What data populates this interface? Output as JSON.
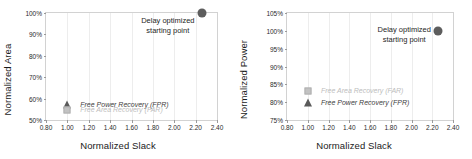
{
  "figure": {
    "panels": [
      {
        "id": "left",
        "ylabel": "Normalized Area",
        "xlabel": "Normalized Slack",
        "yticks": [
          "100%",
          "90%",
          "80%",
          "70%",
          "60%",
          "50%"
        ],
        "xticks": [
          "0.80",
          "1.00",
          "1.20",
          "1.40",
          "1.60",
          "1.80",
          "2.00",
          "2.20",
          "2.40"
        ],
        "annotation_line1": "Delay optimized",
        "annotation_line2": "starting point",
        "label_top": "Free Power Recovery (FPR)",
        "label_bottom": "Free Area Recovery (FAR)"
      },
      {
        "id": "right",
        "ylabel": "Normalized Power",
        "xlabel": "Normalized Slack",
        "yticks": [
          "105%",
          "100%",
          "95%",
          "90%",
          "85%",
          "80%",
          "75%"
        ],
        "xticks": [
          "0.80",
          "1.00",
          "1.20",
          "1.40",
          "1.60",
          "1.80",
          "2.00",
          "2.20",
          "2.40"
        ],
        "annotation_line1": "Delay optimized",
        "annotation_line2": "starting point",
        "label_top": "Free Area Recovery (FAR)",
        "label_bottom": "Free Power Recovery (FPR)"
      }
    ]
  },
  "colors": {
    "circle": "#5d5d5d",
    "triangle": "#5a5a5a",
    "square": "#c2c2c2",
    "grid": "#ededed",
    "frame": "#d2d2d2"
  },
  "chart_data": [
    {
      "type": "scatter",
      "title": "",
      "xlabel": "Normalized Slack",
      "ylabel": "Normalized Area",
      "xlim": [
        0.8,
        2.4
      ],
      "ylim": [
        50,
        100
      ],
      "xticks": [
        0.8,
        1.0,
        1.2,
        1.4,
        1.6,
        1.8,
        2.0,
        2.2,
        2.4
      ],
      "yticks": [
        50,
        60,
        70,
        80,
        90,
        100
      ],
      "ytick_unit": "%",
      "grid": true,
      "legend": "inline-annotations",
      "points": [
        {
          "name": "Delay optimized starting point",
          "marker": "circle",
          "x": 2.26,
          "y": 100
        },
        {
          "name": "Free Power Recovery (FPR)",
          "marker": "triangle",
          "x": 1.0,
          "y": 57
        },
        {
          "name": "Free Area Recovery (FAR)",
          "marker": "square",
          "x": 1.0,
          "y": 54.5
        }
      ],
      "annotations": [
        {
          "text": "Delay optimized starting point",
          "x": 1.95,
          "y": 98
        },
        {
          "text": "Free Power Recovery (FPR)",
          "x": 1.05,
          "y": 57
        },
        {
          "text": "Free Area Recovery (FAR)",
          "x": 1.05,
          "y": 54.5
        }
      ]
    },
    {
      "type": "scatter",
      "title": "",
      "xlabel": "Normalized Slack",
      "ylabel": "Normalized Power",
      "xlim": [
        0.8,
        2.4
      ],
      "ylim": [
        75,
        105
      ],
      "xticks": [
        0.8,
        1.0,
        1.2,
        1.4,
        1.6,
        1.8,
        2.0,
        2.2,
        2.4
      ],
      "yticks": [
        75,
        80,
        85,
        90,
        95,
        100,
        105
      ],
      "ytick_unit": "%",
      "grid": true,
      "legend": "inline-annotations",
      "points": [
        {
          "name": "Delay optimized starting point",
          "marker": "circle",
          "x": 2.26,
          "y": 100
        },
        {
          "name": "Free Area Recovery (FAR)",
          "marker": "square",
          "x": 1.0,
          "y": 83
        },
        {
          "name": "Free Power Recovery (FPR)",
          "marker": "triangle",
          "x": 1.0,
          "y": 79.8
        }
      ],
      "annotations": [
        {
          "text": "Delay optimized starting point",
          "x": 1.95,
          "y": 100
        },
        {
          "text": "Free Area Recovery (FAR)",
          "x": 1.06,
          "y": 83
        },
        {
          "text": "Free Power Recovery (FPR)",
          "x": 1.06,
          "y": 79.8
        }
      ]
    }
  ]
}
